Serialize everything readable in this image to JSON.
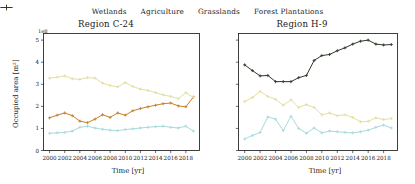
{
  "figure": {
    "ylabel": "Occupied area [m$^2$]",
    "ylabel_display": "Occupied area [m²]",
    "xlabel": "Time [yr]",
    "exponent_label": "1e8"
  },
  "legend": {
    "position": "top-center",
    "entries": [
      {
        "label": "Wetlands",
        "color": "#a8dadc",
        "marker": "+"
      },
      {
        "label": "Agriculture",
        "color": "#c8812a",
        "marker": "+"
      },
      {
        "label": "Grasslands",
        "color": "#e3e0a0",
        "marker": "+"
      },
      {
        "label": "Forest Plantations",
        "color": "#2f3b2a",
        "marker": "+"
      }
    ]
  },
  "chart_data": [
    {
      "type": "line",
      "title": "Region C-24",
      "xlabel": "Time [yr]",
      "ylabel": "Occupied area [m²]",
      "y_exponent": 100000000.0,
      "xlim": [
        1999.2,
        2019.8
      ],
      "ylim": [
        0,
        5.3
      ],
      "xticks": [
        2000,
        2002,
        2004,
        2006,
        2008,
        2010,
        2012,
        2014,
        2016,
        2018
      ],
      "yticks": [
        0,
        1,
        2,
        3,
        4,
        5
      ],
      "grid": false,
      "x": [
        2000,
        2001,
        2002,
        2003,
        2004,
        2005,
        2006,
        2007,
        2008,
        2009,
        2010,
        2011,
        2012,
        2013,
        2014,
        2015,
        2016,
        2017,
        2018,
        2019
      ],
      "series": [
        {
          "name": "Wetlands",
          "color": "#a8dadc",
          "values": [
            0.78,
            0.8,
            0.82,
            0.88,
            1.05,
            1.1,
            1.02,
            0.96,
            0.92,
            0.9,
            0.95,
            0.98,
            1.02,
            1.05,
            1.08,
            1.1,
            1.05,
            1.02,
            1.1,
            0.88
          ]
        },
        {
          "name": "Agriculture",
          "color": "#c8812a",
          "values": [
            1.48,
            1.6,
            1.7,
            1.58,
            1.33,
            1.26,
            1.42,
            1.62,
            1.5,
            1.7,
            1.6,
            1.8,
            1.9,
            1.98,
            2.05,
            2.12,
            2.15,
            2.02,
            1.98,
            2.42
          ]
        },
        {
          "name": "Grasslands",
          "color": "#e3e0a0",
          "values": [
            3.28,
            3.32,
            3.38,
            3.25,
            3.22,
            3.3,
            3.28,
            3.05,
            2.95,
            2.88,
            3.08,
            2.9,
            2.78,
            2.72,
            2.62,
            2.52,
            2.45,
            2.35,
            2.62,
            2.4
          ]
        },
        {
          "name": "Forest Plantations",
          "color": "#2f3b2a",
          "values": [
            null,
            null,
            null,
            null,
            null,
            null,
            null,
            null,
            null,
            null,
            null,
            null,
            null,
            null,
            null,
            null,
            null,
            null,
            null,
            null
          ]
        }
      ]
    },
    {
      "type": "line",
      "title": "Region H-9",
      "xlabel": "Time [yr]",
      "ylabel": "Occupied area [m²]",
      "y_exponent": 100000000.0,
      "xlim": [
        1999.2,
        2019.8
      ],
      "ylim": [
        0,
        5.3
      ],
      "xticks": [
        2000,
        2002,
        2004,
        2006,
        2008,
        2010,
        2012,
        2014,
        2016,
        2018
      ],
      "yticks": [
        0,
        1,
        2,
        3,
        4,
        5
      ],
      "grid": false,
      "x": [
        2000,
        2001,
        2002,
        2003,
        2004,
        2005,
        2006,
        2007,
        2008,
        2009,
        2010,
        2011,
        2012,
        2013,
        2014,
        2015,
        2016,
        2017,
        2018,
        2019
      ],
      "series": [
        {
          "name": "Wetlands",
          "color": "#a8dadc",
          "values": [
            0.52,
            0.68,
            0.82,
            1.52,
            1.42,
            0.9,
            1.55,
            1.0,
            0.78,
            1.02,
            0.8,
            0.88,
            0.85,
            0.82,
            0.8,
            0.85,
            0.92,
            1.05,
            1.15,
            1.02
          ]
        },
        {
          "name": "Agriculture",
          "color": "#c8812a",
          "values": [
            null,
            null,
            null,
            null,
            null,
            null,
            null,
            null,
            null,
            null,
            null,
            null,
            null,
            null,
            null,
            null,
            null,
            null,
            null,
            null
          ]
        },
        {
          "name": "Grasslands",
          "color": "#e3e0a0",
          "values": [
            2.22,
            2.4,
            2.68,
            2.45,
            2.32,
            2.05,
            2.3,
            1.95,
            2.08,
            1.95,
            1.62,
            1.7,
            1.58,
            1.62,
            1.5,
            1.3,
            1.32,
            1.48,
            1.4,
            1.45
          ]
        },
        {
          "name": "Forest Plantations",
          "color": "#2f3b2a",
          "values": [
            3.88,
            3.62,
            3.38,
            3.4,
            3.12,
            3.12,
            3.12,
            3.3,
            3.4,
            4.08,
            4.3,
            4.35,
            4.52,
            4.65,
            4.82,
            4.95,
            5.0,
            4.82,
            4.78,
            4.8
          ]
        }
      ]
    }
  ]
}
